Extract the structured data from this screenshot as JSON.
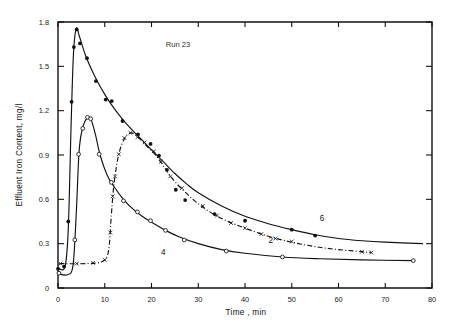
{
  "chart_data": {
    "type": "line",
    "title": "Run 23",
    "xlabel": "Time , min",
    "ylabel": "Effluent Iron Content, mg/l",
    "xlim": [
      0,
      80
    ],
    "ylim": [
      0,
      1.8
    ],
    "xticks": [
      0,
      10,
      20,
      30,
      40,
      50,
      60,
      70,
      80
    ],
    "yticks": [
      0,
      0.3,
      0.6,
      0.9,
      1.2,
      1.5,
      1.8
    ],
    "xtick_labels": [
      "0",
      "10",
      "20",
      "30",
      "40",
      "50",
      "60",
      "70",
      "80"
    ],
    "ytick_labels": [
      "0",
      "0.3",
      "0.6",
      "0.9",
      "1.2",
      "1.5",
      "1.8"
    ],
    "grid": false,
    "legend_position": "inline-curve-labels",
    "series": [
      {
        "name": "6",
        "label": "6",
        "label_x": 56.5,
        "label_y": 0.455,
        "marker": "filled-circle",
        "linestyle": "solid",
        "points": [
          {
            "x": 0.0,
            "y": 0.13
          },
          {
            "x": 1.3,
            "y": 0.145
          },
          {
            "x": 2.2,
            "y": 0.45
          },
          {
            "x": 2.9,
            "y": 1.26
          },
          {
            "x": 3.4,
            "y": 1.63
          },
          {
            "x": 4.0,
            "y": 1.75
          },
          {
            "x": 4.7,
            "y": 1.655
          },
          {
            "x": 6.2,
            "y": 1.555
          },
          {
            "x": 8.1,
            "y": 1.4
          },
          {
            "x": 10.2,
            "y": 1.275
          },
          {
            "x": 11.5,
            "y": 1.265
          },
          {
            "x": 13.8,
            "y": 1.13
          },
          {
            "x": 17.1,
            "y": 1.04
          },
          {
            "x": 19.8,
            "y": 0.975
          },
          {
            "x": 21.6,
            "y": 0.895
          },
          {
            "x": 23.3,
            "y": 0.8
          },
          {
            "x": 25.2,
            "y": 0.665
          },
          {
            "x": 27.2,
            "y": 0.595
          },
          {
            "x": 33.5,
            "y": 0.5
          },
          {
            "x": 40.0,
            "y": 0.455
          },
          {
            "x": 50.0,
            "y": 0.395
          },
          {
            "x": 55.0,
            "y": 0.355
          }
        ],
        "curve": [
          {
            "x": 0.0,
            "y": 0.135
          },
          {
            "x": 1.5,
            "y": 0.145
          },
          {
            "x": 2.2,
            "y": 0.4
          },
          {
            "x": 2.8,
            "y": 1.1
          },
          {
            "x": 3.3,
            "y": 1.58
          },
          {
            "x": 3.9,
            "y": 1.755
          },
          {
            "x": 4.6,
            "y": 1.7
          },
          {
            "x": 6.0,
            "y": 1.565
          },
          {
            "x": 8.0,
            "y": 1.425
          },
          {
            "x": 10.0,
            "y": 1.31
          },
          {
            "x": 12.0,
            "y": 1.215
          },
          {
            "x": 14.0,
            "y": 1.135
          },
          {
            "x": 16.0,
            "y": 1.065
          },
          {
            "x": 18.0,
            "y": 1.0
          },
          {
            "x": 20.0,
            "y": 0.935
          },
          {
            "x": 22.5,
            "y": 0.855
          },
          {
            "x": 25.0,
            "y": 0.775
          },
          {
            "x": 27.5,
            "y": 0.705
          },
          {
            "x": 30.0,
            "y": 0.645
          },
          {
            "x": 35.0,
            "y": 0.555
          },
          {
            "x": 40.0,
            "y": 0.485
          },
          {
            "x": 45.0,
            "y": 0.435
          },
          {
            "x": 50.0,
            "y": 0.395
          },
          {
            "x": 55.0,
            "y": 0.36
          },
          {
            "x": 60.0,
            "y": 0.335
          },
          {
            "x": 65.0,
            "y": 0.32
          },
          {
            "x": 70.0,
            "y": 0.31
          },
          {
            "x": 78.0,
            "y": 0.3
          }
        ]
      },
      {
        "name": "2",
        "label": "2",
        "label_x": 45.5,
        "label_y": 0.305,
        "marker": "cross",
        "linestyle": "dash-dot",
        "points": [
          {
            "x": 0.5,
            "y": 0.165
          },
          {
            "x": 4.0,
            "y": 0.165
          },
          {
            "x": 7.5,
            "y": 0.17
          },
          {
            "x": 10.0,
            "y": 0.19
          },
          {
            "x": 11.2,
            "y": 0.375
          },
          {
            "x": 11.7,
            "y": 0.62
          },
          {
            "x": 12.2,
            "y": 0.755
          },
          {
            "x": 13.0,
            "y": 0.905
          },
          {
            "x": 14.2,
            "y": 1.015
          },
          {
            "x": 15.5,
            "y": 1.05
          },
          {
            "x": 17.0,
            "y": 1.02
          },
          {
            "x": 18.5,
            "y": 0.985
          },
          {
            "x": 20.5,
            "y": 0.925
          },
          {
            "x": 22.0,
            "y": 0.855
          },
          {
            "x": 24.0,
            "y": 0.755
          },
          {
            "x": 26.5,
            "y": 0.675
          },
          {
            "x": 31.0,
            "y": 0.555
          },
          {
            "x": 34.0,
            "y": 0.49
          },
          {
            "x": 37.0,
            "y": 0.44
          },
          {
            "x": 40.0,
            "y": 0.405
          },
          {
            "x": 43.5,
            "y": 0.365
          },
          {
            "x": 46.5,
            "y": 0.335
          },
          {
            "x": 50.0,
            "y": 0.315
          },
          {
            "x": 65.0,
            "y": 0.245
          },
          {
            "x": 67.0,
            "y": 0.24
          }
        ],
        "curve": [
          {
            "x": 0.3,
            "y": 0.165
          },
          {
            "x": 6.0,
            "y": 0.165
          },
          {
            "x": 9.5,
            "y": 0.18
          },
          {
            "x": 10.8,
            "y": 0.25
          },
          {
            "x": 11.4,
            "y": 0.49
          },
          {
            "x": 12.0,
            "y": 0.71
          },
          {
            "x": 13.0,
            "y": 0.905
          },
          {
            "x": 14.3,
            "y": 1.015
          },
          {
            "x": 15.6,
            "y": 1.05
          },
          {
            "x": 17.0,
            "y": 1.025
          },
          {
            "x": 19.0,
            "y": 0.96
          },
          {
            "x": 21.0,
            "y": 0.895
          },
          {
            "x": 23.0,
            "y": 0.805
          },
          {
            "x": 25.0,
            "y": 0.72
          },
          {
            "x": 27.5,
            "y": 0.64
          },
          {
            "x": 30.0,
            "y": 0.57
          },
          {
            "x": 33.0,
            "y": 0.505
          },
          {
            "x": 36.0,
            "y": 0.455
          },
          {
            "x": 40.0,
            "y": 0.405
          },
          {
            "x": 45.0,
            "y": 0.35
          },
          {
            "x": 50.0,
            "y": 0.31
          },
          {
            "x": 55.0,
            "y": 0.28
          },
          {
            "x": 60.0,
            "y": 0.26
          },
          {
            "x": 67.0,
            "y": 0.24
          }
        ]
      },
      {
        "name": "4",
        "label": "4",
        "label_x": 22.5,
        "label_y": 0.225,
        "marker": "open-circle",
        "linestyle": "solid",
        "points": [
          {
            "x": 0.2,
            "y": 0.1
          },
          {
            "x": 3.6,
            "y": 0.325
          },
          {
            "x": 4.4,
            "y": 0.905
          },
          {
            "x": 5.3,
            "y": 1.08
          },
          {
            "x": 6.3,
            "y": 1.155
          },
          {
            "x": 7.0,
            "y": 1.145
          },
          {
            "x": 8.8,
            "y": 0.905
          },
          {
            "x": 11.4,
            "y": 0.715
          },
          {
            "x": 14.0,
            "y": 0.59
          },
          {
            "x": 17.0,
            "y": 0.515
          },
          {
            "x": 19.8,
            "y": 0.455
          },
          {
            "x": 23.0,
            "y": 0.39
          },
          {
            "x": 27.0,
            "y": 0.325
          },
          {
            "x": 36.0,
            "y": 0.25
          },
          {
            "x": 48.0,
            "y": 0.21
          },
          {
            "x": 76.0,
            "y": 0.185
          }
        ],
        "curve": [
          {
            "x": 0.2,
            "y": 0.095
          },
          {
            "x": 2.0,
            "y": 0.09
          },
          {
            "x": 3.2,
            "y": 0.15
          },
          {
            "x": 3.9,
            "y": 0.5
          },
          {
            "x": 4.5,
            "y": 0.92
          },
          {
            "x": 5.2,
            "y": 1.075
          },
          {
            "x": 6.2,
            "y": 1.15
          },
          {
            "x": 7.0,
            "y": 1.145
          },
          {
            "x": 8.0,
            "y": 1.04
          },
          {
            "x": 9.0,
            "y": 0.9
          },
          {
            "x": 10.5,
            "y": 0.765
          },
          {
            "x": 12.0,
            "y": 0.685
          },
          {
            "x": 14.0,
            "y": 0.6
          },
          {
            "x": 16.0,
            "y": 0.535
          },
          {
            "x": 18.0,
            "y": 0.485
          },
          {
            "x": 20.0,
            "y": 0.445
          },
          {
            "x": 23.0,
            "y": 0.39
          },
          {
            "x": 26.0,
            "y": 0.345
          },
          {
            "x": 30.0,
            "y": 0.3
          },
          {
            "x": 35.0,
            "y": 0.26
          },
          {
            "x": 40.0,
            "y": 0.235
          },
          {
            "x": 48.0,
            "y": 0.21
          },
          {
            "x": 56.0,
            "y": 0.198
          },
          {
            "x": 65.0,
            "y": 0.19
          },
          {
            "x": 76.0,
            "y": 0.185
          }
        ]
      }
    ],
    "colors": {
      "line": "#121212",
      "axis": "#111111",
      "text": "#1a1a1a",
      "background": "#ffffff"
    }
  }
}
